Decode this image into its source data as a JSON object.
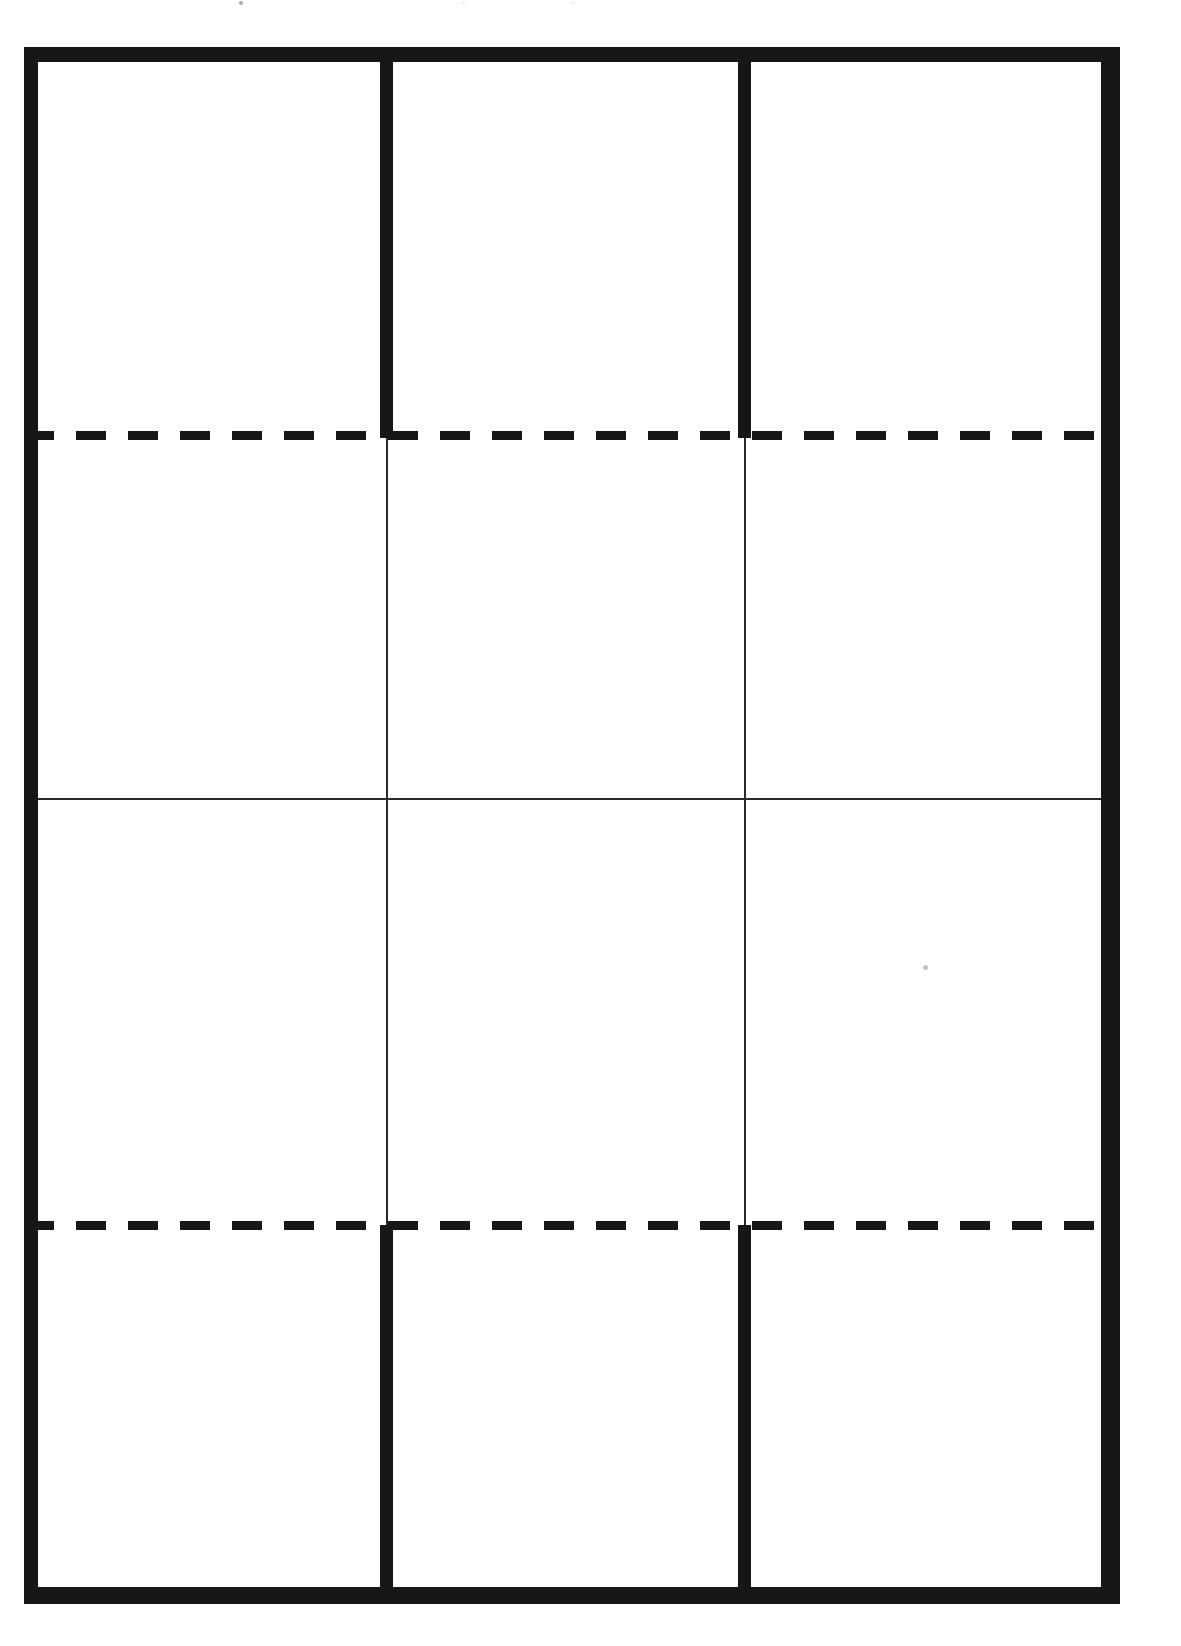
{
  "document": {
    "kind": "scanned-blank-grid-template",
    "page_width": 1181,
    "page_height": 1646,
    "background_color": "#ffffff",
    "ink_color": "#171717",
    "thin_rule_color": "#2b2b2b",
    "text_content": "",
    "notes": "No text, labels, numbers or legends are printed anywhere on this page. The page is an empty ruled grid."
  },
  "frame": {
    "name": "outer-table-border",
    "left": 24,
    "top": 47,
    "width": 1096,
    "height": 1557,
    "border_top_thickness": 15,
    "border_bottom_thickness": 17,
    "border_left_thickness": 14,
    "border_right_thickness": 19
  },
  "grid": {
    "columns": 3,
    "rows": 4,
    "column_dividers": [
      {
        "name": "column-divider-1",
        "x": 356,
        "thick_width": 13,
        "thin_width": 2
      },
      {
        "name": "column-divider-2",
        "x": 714,
        "thick_width": 13,
        "thin_width": 2
      }
    ],
    "row_rules": [
      {
        "name": "row-rule-1",
        "style": "dashed",
        "y": 388,
        "thickness": 9
      },
      {
        "name": "row-rule-2",
        "style": "solid",
        "y": 751,
        "thickness": 2
      },
      {
        "name": "row-rule-3",
        "style": "dashed",
        "y": 1178,
        "thickness": 9
      }
    ],
    "band_segments": [
      {
        "name": "band-top",
        "from_y": 15,
        "to_y": 388,
        "divider_style": "thick"
      },
      {
        "name": "band-upper-middle",
        "from_y": 388,
        "to_y": 751,
        "divider_style": "thin"
      },
      {
        "name": "band-lower-middle",
        "from_y": 751,
        "to_y": 1178,
        "divider_style": "thin"
      },
      {
        "name": "band-bottom",
        "from_y": 1178,
        "to_y": 1540,
        "divider_style": "thick"
      }
    ]
  },
  "cells": [
    {
      "name": "cell-r1c1",
      "row": 1,
      "col": 1,
      "content": ""
    },
    {
      "name": "cell-r1c2",
      "row": 1,
      "col": 2,
      "content": ""
    },
    {
      "name": "cell-r1c3",
      "row": 1,
      "col": 3,
      "content": ""
    },
    {
      "name": "cell-r2c1",
      "row": 2,
      "col": 1,
      "content": ""
    },
    {
      "name": "cell-r2c2",
      "row": 2,
      "col": 2,
      "content": ""
    },
    {
      "name": "cell-r2c3",
      "row": 2,
      "col": 3,
      "content": ""
    },
    {
      "name": "cell-r3c1",
      "row": 3,
      "col": 1,
      "content": ""
    },
    {
      "name": "cell-r3c2",
      "row": 3,
      "col": 2,
      "content": ""
    },
    {
      "name": "cell-r3c3",
      "row": 3,
      "col": 3,
      "content": ""
    },
    {
      "name": "cell-r4c1",
      "row": 4,
      "col": 1,
      "content": ""
    },
    {
      "name": "cell-r4c2",
      "row": 4,
      "col": 2,
      "content": ""
    },
    {
      "name": "cell-r4c3",
      "row": 4,
      "col": 3,
      "content": ""
    }
  ],
  "artifacts": [
    {
      "name": "scan-speck-main",
      "x": 923,
      "y": 965,
      "size": 5,
      "opacity": 0.55
    },
    {
      "name": "scan-speck-top-a",
      "x": 239,
      "y": 1,
      "size": 4,
      "opacity": 0.45
    },
    {
      "name": "scan-speck-top-b",
      "x": 462,
      "y": 1,
      "size": 3,
      "opacity": 0.18
    },
    {
      "name": "scan-speck-top-c",
      "x": 572,
      "y": 1,
      "size": 3,
      "opacity": 0.15
    }
  ]
}
